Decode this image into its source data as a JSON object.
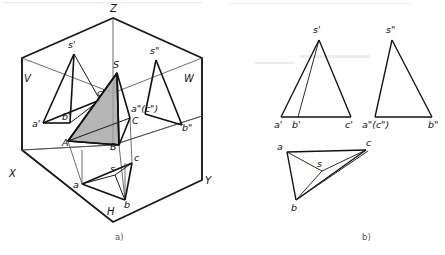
{
  "figure": {
    "title_parts": [
      {
        "id": "part-a",
        "caption": "a)",
        "x": 115,
        "y": 240
      },
      {
        "id": "part-b",
        "caption": "b)",
        "x": 362,
        "y": 240
      }
    ]
  },
  "projection_box": {
    "name": "three-plane-projection-box",
    "outline": "113,18 22,58 22,150 113,222 202,180 202,58",
    "axis_lines": [
      {
        "name": "axis-z-vertical",
        "d": "M113,18 L113,145"
      },
      {
        "name": "axis-x-diagonal",
        "d": "M22,150 L113,145"
      },
      {
        "name": "axis-y-diagonal",
        "d": "M113,145 L202,116"
      },
      {
        "name": "fold-v-h",
        "d": "M22,150 L113,145 L202,116"
      },
      {
        "name": "edge-v-top",
        "d": "M22,58 L113,93"
      },
      {
        "name": "edge-w-top",
        "d": "M113,93 L202,58"
      },
      {
        "name": "edge-center-vertical",
        "d": "M113,93 L113,145"
      }
    ],
    "plane_labels": [
      {
        "name": "plane-label-v",
        "text": "V",
        "x": 24,
        "y": 82
      },
      {
        "name": "plane-label-w",
        "text": "W",
        "x": 184,
        "y": 82
      },
      {
        "name": "plane-label-h",
        "text": "H",
        "x": 107,
        "y": 215
      },
      {
        "name": "axis-label-z",
        "text": "Z",
        "x": 110,
        "y": 12
      },
      {
        "name": "axis-label-x",
        "text": "X",
        "x": 9,
        "y": 177
      },
      {
        "name": "axis-label-y",
        "text": "Y",
        "x": 205,
        "y": 184
      }
    ]
  },
  "pictorial": {
    "name": "pictorial-pyramid-with-projections",
    "front_projection": {
      "name": "front-view-triangle-on-v-plane",
      "apex": {
        "label": "s'",
        "x": 74,
        "y": 54,
        "lx": 68,
        "ly": 48
      },
      "base": [
        {
          "label": "a'",
          "x": 43,
          "y": 123,
          "lx": 32,
          "ly": 127
        },
        {
          "label": "b'",
          "x": 70,
          "y": 123,
          "lx": 62,
          "ly": 120
        },
        {
          "label": "c'",
          "x": 100,
          "y": 100,
          "lx": 97,
          "ly": 96
        }
      ],
      "edges": [
        "M74,54 L43,123",
        "M74,54 L70,123",
        "M74,54 L100,100",
        "M43,123 L70,123",
        "M70,123 L100,100",
        "M43,123 L100,100"
      ]
    },
    "side_projection": {
      "name": "side-view-triangle-on-w-plane",
      "apex": {
        "label": "s\"",
        "x": 156,
        "y": 60,
        "lx": 150,
        "ly": 54
      },
      "base": [
        {
          "label": "a\"(c\")",
          "x": 145,
          "y": 114,
          "lx": 131,
          "ly": 112
        },
        {
          "label": "b\"",
          "x": 182,
          "y": 125,
          "lx": 182,
          "ly": 131
        }
      ],
      "edges": [
        "M156,60 L145,114",
        "M156,60 L182,125",
        "M145,114 L182,125"
      ]
    },
    "top_projection": {
      "name": "top-view-triangle-on-h-plane",
      "apex": {
        "label": "s",
        "x": 115,
        "y": 175,
        "lx": 110,
        "ly": 172
      },
      "base": [
        {
          "label": "a",
          "x": 82,
          "y": 184,
          "lx": 73,
          "ly": 188
        },
        {
          "label": "b",
          "x": 125,
          "y": 200,
          "lx": 124,
          "ly": 208
        },
        {
          "label": "c",
          "x": 132,
          "y": 163,
          "lx": 134,
          "ly": 161
        }
      ],
      "edges": [
        "M82,184 L125,200",
        "M125,200 L132,163",
        "M132,163 L82,184",
        "M115,175 L82,184",
        "M115,175 L125,200",
        "M115,175 L132,163"
      ]
    },
    "solid": {
      "name": "space-pyramid-sabc",
      "shaded_face": "117,73 68,141 119,145",
      "vertices": [
        {
          "label": "S",
          "x": 117,
          "y": 73,
          "lx": 113,
          "ly": 68
        },
        {
          "label": "A",
          "x": 68,
          "y": 141,
          "lx": 62,
          "ly": 146
        },
        {
          "label": "B",
          "x": 119,
          "y": 145,
          "lx": 110,
          "ly": 150
        },
        {
          "label": "C",
          "x": 130,
          "y": 118,
          "lx": 132,
          "ly": 124
        }
      ],
      "edges": [
        "M117,73 L68,141",
        "M117,73 L119,145",
        "M117,73 L130,118",
        "M68,141 L119,145",
        "M119,145 L130,118",
        "M68,141 L130,118"
      ],
      "projector_lines": [
        "M117,73 L113,93",
        "M119,145 L125,200",
        "M130,118 L132,163",
        "M68,141 L82,184",
        "M82,184 L82,150",
        "M125,200 L125,163"
      ]
    }
  },
  "orthographic": {
    "name": "orthographic-three-view-layout",
    "front_view": {
      "name": "front-view-s-prime",
      "apex": {
        "label": "s'",
        "x": 319,
        "y": 40,
        "lx": 313,
        "ly": 33
      },
      "base": [
        {
          "label": "a'",
          "x": 281,
          "y": 117,
          "lx": 274,
          "ly": 128
        },
        {
          "label": "b'",
          "x": 298,
          "y": 117,
          "lx": 292,
          "ly": 128
        },
        {
          "label": "c'",
          "x": 351,
          "y": 117,
          "lx": 345,
          "ly": 128
        }
      ],
      "edges": [
        "M319,40 L281,117",
        "M319,40 L298,117",
        "M319,40 L351,117",
        "M281,117 L351,117"
      ]
    },
    "side_view": {
      "name": "side-view-s-double-prime",
      "apex": {
        "label": "s\"",
        "x": 392,
        "y": 40,
        "lx": 386,
        "ly": 33
      },
      "base": [
        {
          "label": "a\"(c\")",
          "x": 375,
          "y": 117,
          "lx": 362,
          "ly": 128
        },
        {
          "label": "b\"",
          "x": 432,
          "y": 117,
          "lx": 428,
          "ly": 128
        }
      ],
      "edges": [
        "M392,40 L375,117",
        "M392,40 L432,117",
        "M375,117 L432,117"
      ]
    },
    "top_view": {
      "name": "top-view-plan",
      "apex": {
        "label": "s",
        "x": 322,
        "y": 171,
        "lx": 317,
        "ly": 167
      },
      "base": [
        {
          "label": "a",
          "x": 287,
          "y": 152,
          "lx": 277,
          "ly": 150
        },
        {
          "label": "c",
          "x": 366,
          "y": 150,
          "lx": 366,
          "ly": 146
        },
        {
          "label": "b",
          "x": 296,
          "y": 200,
          "lx": 291,
          "ly": 211
        }
      ],
      "edges": [
        "M287,152 L366,150",
        "M366,150 L296,200",
        "M296,200 L287,152",
        "M322,171 L287,152",
        "M322,171 L366,150",
        "M322,171 L296,200",
        "M296,200 L368,151"
      ]
    }
  },
  "colors": {
    "ink": "#111111",
    "box_ink": "#1a1a1a",
    "thin_ink": "#4a4a4a",
    "shaded_face": "#a9a9a9",
    "caption": "#555555",
    "background": "#ffffff"
  }
}
